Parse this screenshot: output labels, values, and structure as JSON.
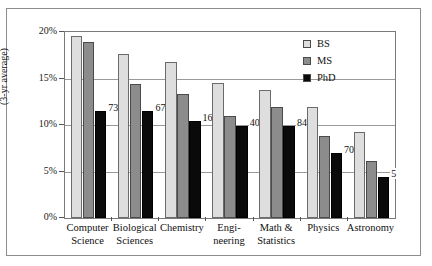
{
  "chart_data": {
    "type": "bar",
    "title": "",
    "xlabel": "",
    "ylabel": "(3-yr average)",
    "ylim": [
      0,
      20
    ],
    "ytick_labels": [
      "0%",
      "5%",
      "10%",
      "15%",
      "20%"
    ],
    "ytick_values": [
      0,
      5,
      10,
      15,
      20
    ],
    "grid": true,
    "legend_position": "top-right",
    "categories": [
      "Computer Science",
      "Biological Sciences",
      "Chemistry",
      "Engineering",
      "Math & Statistics",
      "Physics",
      "Astronomy"
    ],
    "category_lines": [
      [
        "Computer",
        "Science"
      ],
      [
        "Biological",
        "Sciences"
      ],
      [
        "Chemistry",
        ""
      ],
      [
        "Engi-",
        "neering"
      ],
      [
        "Math &",
        "Statistics"
      ],
      [
        "Physics",
        ""
      ],
      [
        "Astronomy",
        ""
      ]
    ],
    "series": [
      {
        "name": "BS",
        "color": "#dedede",
        "values": [
          19.6,
          17.6,
          16.8,
          14.5,
          13.8,
          11.9,
          9.3
        ]
      },
      {
        "name": "MS",
        "color": "#8c8c8c",
        "values": [
          18.9,
          14.4,
          13.3,
          11.0,
          11.9,
          8.8,
          6.1
        ]
      },
      {
        "name": "PhD",
        "color": "#0a0a0a",
        "values": [
          11.5,
          11.5,
          10.4,
          9.9,
          9.9,
          7.0,
          4.4
        ]
      }
    ],
    "annotations": [
      {
        "category": "Computer Science",
        "series": "PhD",
        "label": "73"
      },
      {
        "category": "Biological Sciences",
        "series": "PhD",
        "label": "671"
      },
      {
        "category": "Chemistry",
        "series": "PhD",
        "label": "168"
      },
      {
        "category": "Engineering",
        "series": "PhD",
        "label": "402"
      },
      {
        "category": "Math & Statistics",
        "series": "PhD",
        "label": "84"
      },
      {
        "category": "Physics",
        "series": "PhD",
        "label": "70"
      },
      {
        "category": "Astronomy",
        "series": "PhD",
        "label": "5"
      }
    ]
  },
  "legend": {
    "items": [
      {
        "label": "BS",
        "color": "#dedede"
      },
      {
        "label": "MS",
        "color": "#8c8c8c"
      },
      {
        "label": "PhD",
        "color": "#0a0a0a"
      }
    ]
  }
}
